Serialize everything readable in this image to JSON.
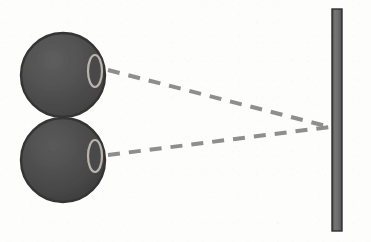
{
  "figure": {
    "background_color": "#fdfdfc",
    "width": 371,
    "height": 242
  },
  "colors": {
    "sphere_fill": "#4f4f4f",
    "sphere_fill_light": "#5c5c5c",
    "sphere_fill_dark": "#3e3e3e",
    "sphere_outline": "#343434",
    "lens_outline": "#b9b5ad",
    "lens_fill": "#4a4a4a",
    "dash_line": "#8e8e8e",
    "bar_fill": "#6b6b6b",
    "bar_outline": "#2f2f2f"
  },
  "chart_data": {
    "type": "diagram",
    "elements": [
      {
        "name": "upper-eye",
        "shape": "circle",
        "cx": 63,
        "cy": 75,
        "r": 42,
        "fill": "#4f4f4f",
        "outline": "#343434"
      },
      {
        "name": "lower-eye",
        "shape": "circle",
        "cx": 63,
        "cy": 160,
        "r": 42,
        "fill": "#4f4f4f",
        "outline": "#343434"
      },
      {
        "name": "upper-lens",
        "shape": "ellipse",
        "cx": 95,
        "cy": 71,
        "rx": 7,
        "ry": 16,
        "outline": "#b9b5ad"
      },
      {
        "name": "lower-lens",
        "shape": "ellipse",
        "cx": 95,
        "cy": 156,
        "rx": 7,
        "ry": 16,
        "outline": "#b9b5ad"
      },
      {
        "name": "upper-sight-line",
        "shape": "dashed-line",
        "x1": 108,
        "y1": 70,
        "x2": 330,
        "y2": 127,
        "stroke": "#8e8e8e",
        "stroke_width": 4,
        "dash": "12 9"
      },
      {
        "name": "lower-sight-line",
        "shape": "dashed-line",
        "x1": 108,
        "y1": 155,
        "x2": 330,
        "y2": 127,
        "stroke": "#8e8e8e",
        "stroke_width": 4,
        "dash": "12 9"
      },
      {
        "name": "vertical-bar",
        "shape": "rect",
        "x": 332,
        "y": 9,
        "width": 10,
        "height": 222,
        "fill": "#6b6b6b",
        "outline": "#2f2f2f"
      }
    ],
    "convergence_point": {
      "x": 330,
      "y": 127
    },
    "axis_ranges": {
      "x": [
        0,
        371
      ],
      "y": [
        0,
        242
      ]
    },
    "grid": false,
    "legend": null
  }
}
